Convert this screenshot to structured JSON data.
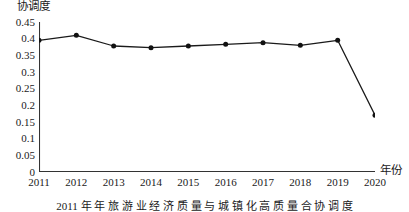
{
  "chart_data": {
    "type": "line",
    "title": "",
    "xlabel": "年份",
    "ylabel": "协调度",
    "categories": [
      "2011",
      "2012",
      "2013",
      "2014",
      "2015",
      "2016",
      "2017",
      "2018",
      "2019",
      "2020"
    ],
    "x": [
      2011,
      2012,
      2013,
      2014,
      2015,
      2016,
      2017,
      2018,
      2019,
      2020
    ],
    "values": [
      0.395,
      0.41,
      0.378,
      0.373,
      0.378,
      0.383,
      0.388,
      0.38,
      0.395,
      0.17
    ],
    "series": [
      {
        "name": "协调度",
        "values": [
          0.395,
          0.41,
          0.378,
          0.373,
          0.378,
          0.383,
          0.388,
          0.38,
          0.395,
          0.17
        ],
        "color": "#1a1a1a",
        "marker": "circle"
      }
    ],
    "ylim": [
      0,
      0.45
    ],
    "xlim": [
      2011,
      2020
    ],
    "yticks": [
      0,
      0.05,
      0.1,
      0.15,
      0.2,
      0.25,
      0.3,
      0.35,
      0.4,
      0.45
    ],
    "ytick_labels": [
      "0",
      "0.05",
      "0.1",
      "0.15",
      "0.2",
      "0.25",
      "0.3",
      "0.35",
      "0.4",
      "0.45"
    ],
    "xticks": [
      2011,
      2012,
      2013,
      2014,
      2015,
      2016,
      2017,
      2018,
      2019,
      2020
    ],
    "xtick_labels": [
      "2011",
      "2012",
      "2013",
      "2014",
      "2015",
      "2016",
      "2017",
      "2018",
      "2019",
      "2020"
    ],
    "grid": false,
    "legend": false,
    "legend_position": "none",
    "annotations": []
  },
  "caption": {
    "text": "2011 年 年 旅 游 业 经 济 质 量 与 城 镇 化 高 质 量 合 协 调 度"
  },
  "style": {
    "line_color": "#1a1a1a",
    "marker_color": "#111111",
    "axis_color": "#333333",
    "background": "#ffffff"
  }
}
